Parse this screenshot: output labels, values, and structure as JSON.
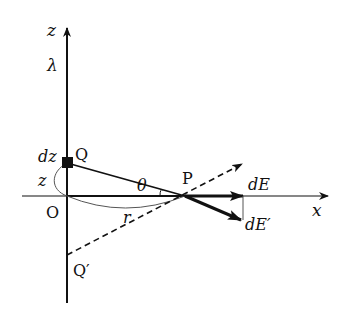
{
  "figure": {
    "labels": {
      "z_axis": "z",
      "x_axis": "x",
      "lambda": "λ",
      "dz": "dz",
      "Q": "Q",
      "z": "z",
      "O": "O",
      "theta": "θ",
      "P": "P",
      "r": "r",
      "dE": "dE",
      "dE_prime": "dE′",
      "Q_prime": "Q′"
    },
    "colors": {
      "ink": "#111111",
      "thin": "#555555",
      "background": "#ffffff"
    }
  }
}
